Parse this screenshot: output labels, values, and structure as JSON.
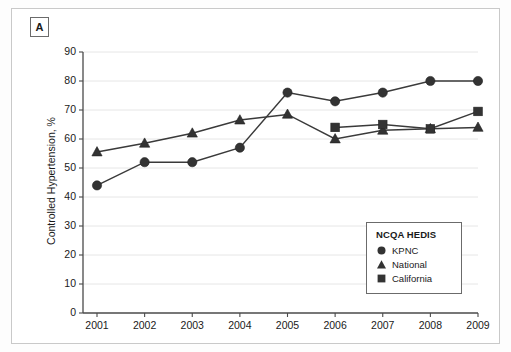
{
  "panel": {
    "letter": "A"
  },
  "chart_data": {
    "type": "line",
    "title": "",
    "xlabel": "",
    "ylabel": "Controlled Hypertension, %",
    "legend_title": "NCQA HEDIS",
    "legend_position": "bottom-right",
    "grid": true,
    "x": [
      "2001",
      "2002",
      "2003",
      "2004",
      "2005",
      "2006",
      "2007",
      "2008",
      "2009"
    ],
    "xlim": [
      2000.6,
      2009.4
    ],
    "ylim": [
      0,
      90
    ],
    "yticks": [
      0,
      10,
      20,
      30,
      40,
      50,
      60,
      70,
      80,
      90
    ],
    "ytick_labels": [
      "0",
      "10",
      "20",
      "30",
      "40",
      "50",
      "60",
      "70",
      "80",
      "90"
    ],
    "xtick_labels": [
      "2001",
      "2002",
      "2003",
      "2004",
      "2005",
      "2006",
      "2007",
      "2008",
      "2009"
    ],
    "series": [
      {
        "name": "KPNC",
        "marker": "circle",
        "color": "#333333",
        "values": [
          44,
          52,
          52,
          57,
          76,
          73,
          76,
          80,
          80
        ]
      },
      {
        "name": "National",
        "marker": "triangle",
        "color": "#333333",
        "values": [
          55.5,
          58.5,
          62,
          66.5,
          68.5,
          60,
          63,
          63.5,
          64
        ]
      },
      {
        "name": "California",
        "marker": "square",
        "color": "#333333",
        "values": [
          null,
          null,
          null,
          null,
          null,
          64,
          65,
          63.5,
          69.5
        ]
      }
    ]
  }
}
